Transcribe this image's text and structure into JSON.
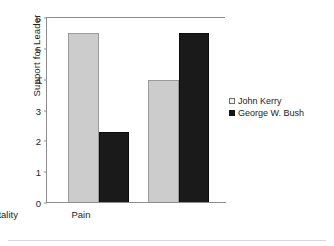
{
  "chart_data": {
    "type": "bar",
    "title": "",
    "subtitle": "",
    "xlabel": "",
    "ylabel": "Support for Leader",
    "categories": [
      "Pain",
      "Mortality"
    ],
    "series": [
      {
        "name": "John Kerry",
        "color": "#cccccc",
        "values": [
          5.5,
          4.0
        ]
      },
      {
        "name": "George W. Bush",
        "color": "#1a1a1a",
        "values": [
          2.3,
          5.5
        ]
      }
    ],
    "ylim": [
      0,
      6
    ],
    "yticks": [
      0,
      1,
      2,
      3,
      4,
      5,
      6
    ],
    "ytick_labels": [
      "0",
      "1",
      "2",
      "3",
      "4",
      "5",
      "6"
    ],
    "grid": false,
    "legend_position": "right",
    "annotations": []
  },
  "axes": {
    "y_title": "Support for Leader",
    "tick_0": "0",
    "tick_1": "1",
    "tick_2": "2",
    "tick_3": "3",
    "tick_4": "4",
    "tick_5": "5",
    "tick_6": "6",
    "cat_0": "Pain",
    "cat_1": "Mortality"
  },
  "legend": {
    "items": [
      {
        "label": "John Kerry"
      },
      {
        "label": "George W. Bush"
      }
    ]
  }
}
